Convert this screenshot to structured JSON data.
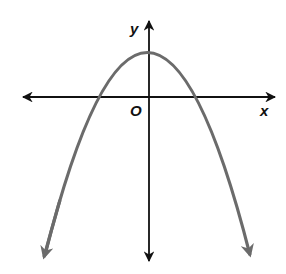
{
  "diagram": {
    "type": "coordinate-graph",
    "labels": {
      "x_axis": "x",
      "y_axis": "y",
      "origin": "O"
    },
    "colors": {
      "background": "#ffffff",
      "axes": "#111111",
      "curve": "#6b6b6b"
    },
    "axes": {
      "origin_px": [
        149,
        97
      ],
      "x_axis_px": {
        "from": [
          22,
          97
        ],
        "to": [
          276,
          97
        ]
      },
      "y_axis_px": {
        "from": [
          149,
          262
        ],
        "to": [
          149,
          20
        ]
      }
    },
    "curve": {
      "kind": "parabola",
      "opens": "down",
      "vertex_px": [
        147,
        46
      ],
      "x_intercepts_px": [
        [
          96,
          97
        ],
        [
          198,
          97
        ]
      ],
      "endpoints_px": [
        [
          42,
          262
        ],
        [
          253,
          262
        ]
      ],
      "arrowheads": "both ends"
    }
  }
}
